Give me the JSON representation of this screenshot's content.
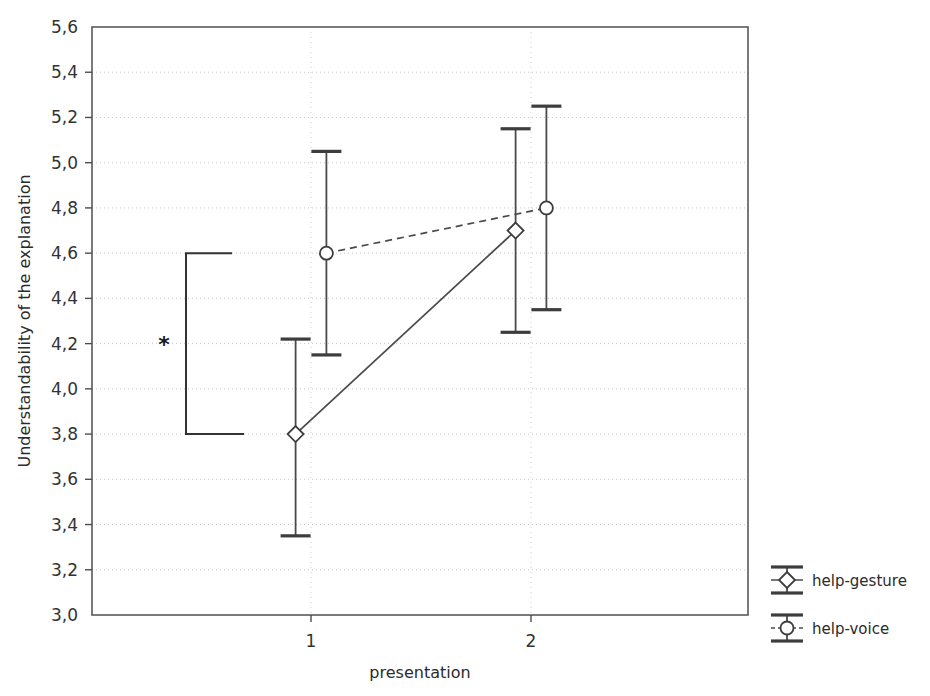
{
  "chart_data": {
    "type": "line",
    "title": "",
    "subtitle": "",
    "xlabel": "presentation",
    "ylabel": "Understandability of the explanation",
    "x": [
      1,
      2
    ],
    "xtick_labels": [
      "1",
      "2"
    ],
    "ylim": [
      3.0,
      5.6
    ],
    "ytick_labels": [
      "3,0",
      "3,2",
      "3,4",
      "3,6",
      "3,8",
      "4,0",
      "4,2",
      "4,4",
      "4,6",
      "4,8",
      "5,0",
      "5,2",
      "5,4",
      "5,6"
    ],
    "ytick_values": [
      3.0,
      3.2,
      3.4,
      3.6,
      3.8,
      4.0,
      4.2,
      4.4,
      4.6,
      4.8,
      5.0,
      5.2,
      5.4,
      5.6
    ],
    "decimal_separator": ",",
    "grid": true,
    "grid_axis": "both",
    "legend_position": "right",
    "error_bars": "95% confidence interval",
    "series": [
      {
        "name": "help-gesture",
        "marker": "diamond",
        "linestyle": "solid",
        "x_offset": -0.07,
        "values": [
          3.8,
          4.7
        ],
        "error_low": [
          3.35,
          4.25
        ],
        "error_high": [
          4.22,
          5.15
        ]
      },
      {
        "name": "help-voice",
        "marker": "circle",
        "linestyle": "dashed",
        "x_offset": 0.07,
        "values": [
          4.6,
          4.8
        ],
        "error_low": [
          4.15,
          4.35
        ],
        "error_high": [
          5.05,
          5.25
        ]
      }
    ],
    "annotations": [
      {
        "type": "significance-bracket",
        "label": "*",
        "from_value": 3.8,
        "to_value": 4.6,
        "note": "significant difference marker"
      }
    ]
  },
  "legend": {
    "items": [
      {
        "label": "help-gesture",
        "marker": "diamond"
      },
      {
        "label": "help-voice",
        "marker": "circle"
      }
    ]
  },
  "axes": {
    "x_title": "presentation",
    "y_title": "Understandability of the explanation"
  },
  "colors": {
    "line": "#4a4a4a",
    "marker_fill": "#ffffff",
    "marker_stroke": "#3d3d3d",
    "grid": "#c8c8c8",
    "frame": "#595959",
    "text": "#2b2b2b",
    "background": "#ffffff"
  }
}
